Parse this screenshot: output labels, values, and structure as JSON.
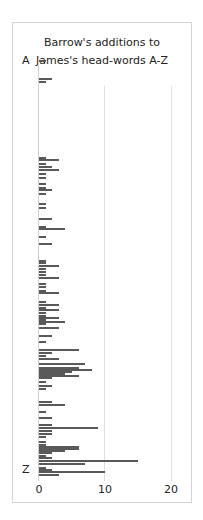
{
  "chart_data": {
    "type": "bar",
    "orientation": "horizontal",
    "title": "Barrow's additions to James's head-words A-Z",
    "title_lines": [
      "Barrow's additions to",
      "James's head-words A-Z"
    ],
    "xlabel": "",
    "ylabel": "",
    "xlim": [
      0,
      21
    ],
    "x_ticks": [
      "0",
      "10",
      "20"
    ],
    "y_labels": {
      "top": "A",
      "bottom": "Z"
    },
    "grid": true,
    "legend": null,
    "bar_color": "#595959",
    "rows": [
      {
        "y": 60,
        "value": 1
      },
      {
        "y": 78,
        "value": 2
      },
      {
        "y": 81,
        "value": 1
      },
      {
        "y": 157,
        "value": 1
      },
      {
        "y": 159,
        "value": 3
      },
      {
        "y": 163,
        "value": 1
      },
      {
        "y": 166,
        "value": 2
      },
      {
        "y": 169,
        "value": 3
      },
      {
        "y": 173,
        "value": 1
      },
      {
        "y": 177,
        "value": 1
      },
      {
        "y": 183,
        "value": 1
      },
      {
        "y": 187,
        "value": 1
      },
      {
        "y": 189,
        "value": 2
      },
      {
        "y": 193,
        "value": 1
      },
      {
        "y": 203,
        "value": 1
      },
      {
        "y": 207,
        "value": 1
      },
      {
        "y": 218,
        "value": 2
      },
      {
        "y": 226,
        "value": 1
      },
      {
        "y": 228,
        "value": 4
      },
      {
        "y": 236,
        "value": 1
      },
      {
        "y": 243,
        "value": 2
      },
      {
        "y": 260,
        "value": 1
      },
      {
        "y": 262,
        "value": 1
      },
      {
        "y": 265,
        "value": 3
      },
      {
        "y": 268,
        "value": 1
      },
      {
        "y": 271,
        "value": 1
      },
      {
        "y": 274,
        "value": 1
      },
      {
        "y": 277,
        "value": 3
      },
      {
        "y": 283,
        "value": 1
      },
      {
        "y": 286,
        "value": 1
      },
      {
        "y": 290,
        "value": 1
      },
      {
        "y": 292,
        "value": 3
      },
      {
        "y": 301,
        "value": 1
      },
      {
        "y": 304,
        "value": 3
      },
      {
        "y": 307,
        "value": 1
      },
      {
        "y": 309,
        "value": 3
      },
      {
        "y": 312,
        "value": 1
      },
      {
        "y": 315,
        "value": 1
      },
      {
        "y": 317,
        "value": 3
      },
      {
        "y": 319,
        "value": 1
      },
      {
        "y": 321,
        "value": 4
      },
      {
        "y": 323,
        "value": 1
      },
      {
        "y": 327,
        "value": 3
      },
      {
        "y": 335,
        "value": 2
      },
      {
        "y": 341,
        "value": 1
      },
      {
        "y": 349,
        "value": 6
      },
      {
        "y": 352,
        "value": 2
      },
      {
        "y": 355,
        "value": 1
      },
      {
        "y": 358,
        "value": 3
      },
      {
        "y": 363,
        "value": 7
      },
      {
        "y": 367,
        "value": 6
      },
      {
        "y": 369,
        "value": 8
      },
      {
        "y": 371,
        "value": 5
      },
      {
        "y": 373,
        "value": 4
      },
      {
        "y": 375,
        "value": 6
      },
      {
        "y": 377,
        "value": 2
      },
      {
        "y": 381,
        "value": 1
      },
      {
        "y": 385,
        "value": 2
      },
      {
        "y": 388,
        "value": 1
      },
      {
        "y": 401,
        "value": 2
      },
      {
        "y": 404,
        "value": 4
      },
      {
        "y": 411,
        "value": 1
      },
      {
        "y": 417,
        "value": 2
      },
      {
        "y": 424,
        "value": 2
      },
      {
        "y": 427,
        "value": 9
      },
      {
        "y": 430,
        "value": 2
      },
      {
        "y": 433,
        "value": 2
      },
      {
        "y": 436,
        "value": 1
      },
      {
        "y": 441,
        "value": 1
      },
      {
        "y": 444,
        "value": 1
      },
      {
        "y": 446,
        "value": 6
      },
      {
        "y": 448,
        "value": 6
      },
      {
        "y": 450,
        "value": 4
      },
      {
        "y": 452,
        "value": 2
      },
      {
        "y": 455,
        "value": 1
      },
      {
        "y": 457,
        "value": 2
      },
      {
        "y": 460,
        "value": 15
      },
      {
        "y": 463,
        "value": 7
      },
      {
        "y": 467,
        "value": 1
      },
      {
        "y": 469,
        "value": 2
      },
      {
        "y": 471,
        "value": 10
      },
      {
        "y": 474,
        "value": 3
      }
    ]
  }
}
